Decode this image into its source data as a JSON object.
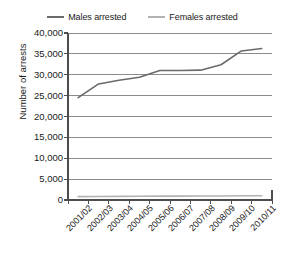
{
  "chart_data": {
    "type": "line",
    "title": "",
    "xlabel": "",
    "ylabel": "Number of arrests",
    "categories": [
      "2001/02",
      "2002/03",
      "2003/04",
      "2004/05",
      "2005/06",
      "2006/07",
      "2007/08",
      "2008/09",
      "2009/10",
      "2010/11"
    ],
    "series": [
      {
        "name": "Males arrested",
        "color": "#6a6a6a",
        "values": [
          24500,
          27800,
          28700,
          29400,
          31000,
          31000,
          31100,
          32400,
          35700,
          36300
        ]
      },
      {
        "name": "Females arrested",
        "color": "#b3b3b3",
        "values": [
          800,
          850,
          880,
          900,
          920,
          930,
          950,
          960,
          1000,
          1000
        ]
      }
    ],
    "ylim": [
      0,
      40000
    ],
    "y_ticks": [
      0,
      5000,
      10000,
      15000,
      20000,
      25000,
      30000,
      35000,
      40000
    ],
    "y_tick_labels": [
      "0",
      "5,000",
      "10,000",
      "15,000",
      "20,000",
      "25,000",
      "30,000",
      "35,000",
      "40,000"
    ],
    "grid": "horizontal",
    "legend_position": "top"
  },
  "legend": {
    "entries": [
      {
        "label": "Males arrested",
        "color": "#6a6a6a"
      },
      {
        "label": "Females arrested",
        "color": "#b3b3b3"
      }
    ]
  },
  "axis": {
    "y_title": "Number of arrests"
  }
}
